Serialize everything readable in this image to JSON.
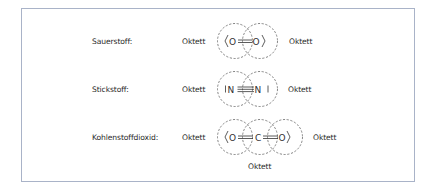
{
  "rows": [
    {
      "name": "Sauerstoff:",
      "left_label": "Oktett",
      "right_label": "Oktett",
      "formula": "O=O",
      "atoms": [
        "O",
        "O"
      ],
      "bond": "double",
      "lone_pairs": "2 per oxygen (drawn as angled lines)"
    },
    {
      "name": "Stickstoff:",
      "left_label": "Oktett",
      "right_label": "Oktett",
      "formula": "N≡N",
      "atoms": [
        "N",
        "N"
      ],
      "bond": "triple",
      "lone_pairs": "1 per nitrogen (drawn as vertical line)"
    },
    {
      "name": "Kohlenstoffdioxid:",
      "left_label": "Oktett",
      "right_label": "Oktett",
      "bottom_label": "Oktett",
      "formula": "O=C=O",
      "atoms": [
        "O",
        "C",
        "O"
      ],
      "bond": "double",
      "lone_pairs": "2 per oxygen (drawn as angled lines)"
    }
  ],
  "colors": {
    "frame_border": "#a9b3c8",
    "text": "#2a2a2a",
    "circle_dash": "#555555"
  }
}
